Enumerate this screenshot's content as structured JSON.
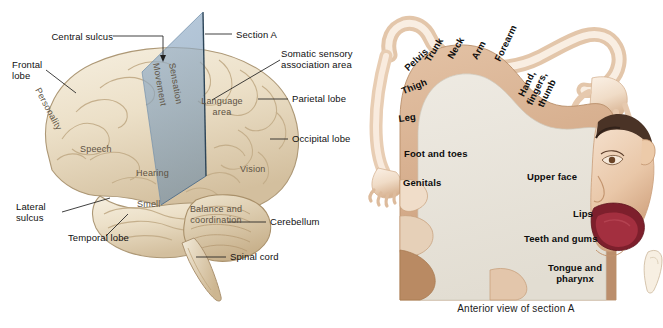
{
  "figure": {
    "background_color": "#ffffff"
  },
  "colors": {
    "brain_fill": "#e9dcc3",
    "brain_fill_light": "#f3ebd9",
    "brain_shadow": "#c9b696",
    "brain_outline": "#b49f7d",
    "section_plane": "#8aa7c4",
    "section_plane_dark": "#5d7f9e",
    "leader_line": "#1f1f1f",
    "on_brain_text": "#5d5243",
    "cortex_strip": "#d9b496",
    "cortex_strip_shadow": "#bb8e6c",
    "cortex_interior": "#e9e5dc",
    "skin": "#f3e0ce",
    "skin_shadow": "#dcb795",
    "hair": "#4a3326",
    "tongue": "#a32f3f",
    "mouth_dark": "#7d1f2c",
    "label_text": "#141414"
  },
  "brain_panel": {
    "callouts": [
      {
        "id": "central-sulcus",
        "text": "Central sulcus"
      },
      {
        "id": "section-a",
        "text": "Section A"
      },
      {
        "id": "somatic-sensory-association-area",
        "text": "Somatic sensory\nassociation area"
      },
      {
        "id": "frontal-lobe",
        "text": "Frontal\nlobe"
      },
      {
        "id": "parietal-lobe",
        "text": "Parietal lobe"
      },
      {
        "id": "occipital-lobe",
        "text": "Occipital lobe"
      },
      {
        "id": "cerebellum",
        "text": "Cerebellum"
      },
      {
        "id": "spinal-cord",
        "text": "Spinal cord"
      },
      {
        "id": "lateral-sulcus",
        "text": "Lateral\nsulcus"
      },
      {
        "id": "temporal-lobe",
        "text": "Temporal lobe"
      }
    ],
    "surface_regions": [
      {
        "id": "personality",
        "text": "Personality"
      },
      {
        "id": "movement",
        "text": "Movement"
      },
      {
        "id": "sensation",
        "text": "Sensation"
      },
      {
        "id": "language-area",
        "text": "Language\narea"
      },
      {
        "id": "speech",
        "text": "Speech"
      },
      {
        "id": "hearing",
        "text": "Hearing"
      },
      {
        "id": "vision",
        "text": "Vision"
      },
      {
        "id": "smell",
        "text": "Smell"
      },
      {
        "id": "balance-and-coordination",
        "text": "Balance and\ncoordination"
      }
    ]
  },
  "homunculus_panel": {
    "caption": "Anterior view of section A",
    "labels": [
      {
        "id": "pelvis",
        "text": "Pelvis"
      },
      {
        "id": "trunk",
        "text": "Trunk"
      },
      {
        "id": "neck",
        "text": "Neck"
      },
      {
        "id": "arm",
        "text": "Arm"
      },
      {
        "id": "forearm",
        "text": "Forearm"
      },
      {
        "id": "thigh",
        "text": "Thigh"
      },
      {
        "id": "leg",
        "text": "Leg"
      },
      {
        "id": "hand-fingers-thumb",
        "text": "Hand,\nfingers,\nthumb"
      },
      {
        "id": "foot-and-toes",
        "text": "Foot and toes"
      },
      {
        "id": "genitals",
        "text": "Genitals"
      },
      {
        "id": "upper-face",
        "text": "Upper face"
      },
      {
        "id": "lips",
        "text": "Lips"
      },
      {
        "id": "teeth-and-gums",
        "text": "Teeth and gums"
      },
      {
        "id": "tongue-and-pharynx",
        "text": "Tongue and\npharynx"
      }
    ]
  }
}
